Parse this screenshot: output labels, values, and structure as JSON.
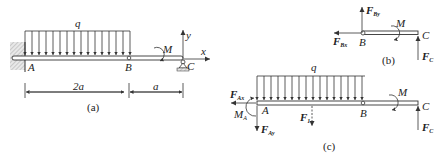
{
  "figure": {
    "panels": [
      {
        "id": "a",
        "caption": "(a)",
        "labels": {
          "load": "q",
          "point_a": "A",
          "point_b": "B",
          "point_c": "C",
          "moment": "M",
          "axis_x": "x",
          "axis_y": "y",
          "dim_left": "2a",
          "dim_right": "a"
        }
      },
      {
        "id": "b",
        "caption": "(b)",
        "labels": {
          "force_by": "F",
          "force_by_sub": "By",
          "force_bx": "F",
          "force_bx_sub": "Bx",
          "point_b": "B",
          "point_c": "C",
          "moment": "M",
          "force_c": "F",
          "force_c_sub": "C"
        }
      },
      {
        "id": "c",
        "caption": "(c)",
        "labels": {
          "load": "q",
          "force_ax": "F",
          "force_ax_sub": "Ax",
          "moment_a": "M",
          "moment_a_sub": "A",
          "point_a": "A",
          "force_ay": "F",
          "force_ay_sub": "Ay",
          "resultant": "F",
          "resultant_sub": "1",
          "point_b": "B",
          "moment": "M",
          "point_c": "C",
          "force_c": "F",
          "force_c_sub": "C"
        }
      }
    ]
  }
}
